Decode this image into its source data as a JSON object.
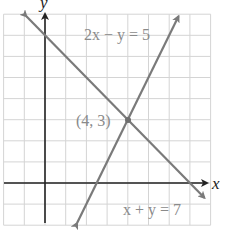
{
  "chart_data": {
    "type": "line",
    "title": "",
    "xlabel": "x",
    "ylabel": "y",
    "xlim": [
      -2,
      8
    ],
    "ylim": [
      -2,
      8
    ],
    "grid": true,
    "series": [
      {
        "name": "x + y = 7",
        "equation": "x + y = 7",
        "color": "#7a7a7a",
        "x": [
          -0.9,
          7.7
        ],
        "y": [
          7.9,
          -0.7
        ]
      },
      {
        "name": "2x − y = 5",
        "equation": "2x − y = 5",
        "color": "#7a7a7a",
        "x": [
          1.55,
          6.45
        ],
        "y": [
          -1.9,
          7.9
        ]
      }
    ],
    "annotations": [
      {
        "text": "(4, 3)",
        "x": 4,
        "y": 3,
        "type": "intersection-point"
      },
      {
        "text": "2x − y = 5",
        "type": "line-label"
      },
      {
        "text": "x + y = 7",
        "type": "line-label"
      }
    ]
  },
  "labels": {
    "x_axis": "x",
    "y_axis": "y",
    "line1": "2x − y = 5",
    "line2": "x + y = 7",
    "point": "(4, 3)"
  },
  "colors": {
    "grid": "#d4d4d4",
    "axis": "#222222",
    "line": "#7a7a7a",
    "text": "#8a8a8a"
  }
}
